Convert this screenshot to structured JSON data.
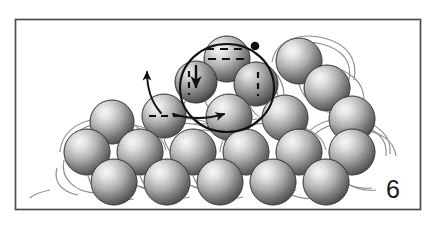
{
  "figure": {
    "panel_label": "6",
    "title": "",
    "frame": {
      "x": 15,
      "y": 19,
      "width": 406,
      "height": 191,
      "border_color": "#4d4d4d",
      "background_color": "#ffffff"
    },
    "canvas": {
      "width": 435,
      "height": 226,
      "background_color": "#ffffff"
    },
    "style": {
      "sphere_fill_light": "#fdfdfd",
      "sphere_fill_mid": "#c9c9c9",
      "sphere_fill_dark": "#8a8a8a",
      "sphere_edge_color": "#6e6e6e",
      "bond_color": "#8d8d8d",
      "annotation_color": "#111111",
      "dashed_color": "#111111"
    },
    "spheres": [
      {
        "name": "atom-back-row-1",
        "cx": 113,
        "cy": 125,
        "r": 22,
        "layer": "back"
      },
      {
        "name": "atom-back-row-2",
        "cx": 166,
        "cy": 125,
        "r": 22,
        "layer": "back"
      },
      {
        "name": "atom-back-row-3",
        "cx": 219,
        "cy": 125,
        "r": 22,
        "layer": "back"
      },
      {
        "name": "atom-back-row-4",
        "cx": 272,
        "cy": 125,
        "r": 22,
        "layer": "back"
      },
      {
        "name": "atom-back-row-5",
        "cx": 325,
        "cy": 125,
        "r": 22,
        "layer": "back"
      },
      {
        "name": "atom-upper-left-1",
        "cx": 112,
        "cy": 122,
        "r": 22,
        "layer": "upper"
      },
      {
        "name": "atom-upper-terrace-a",
        "cx": 163,
        "cy": 119,
        "r": 22,
        "layer": "upper"
      },
      {
        "name": "atom-upper-terrace-b",
        "cx": 267,
        "cy": 122,
        "r": 22,
        "layer": "upper"
      },
      {
        "name": "atom-upper-terrace-c",
        "cx": 320,
        "cy": 122,
        "r": 22,
        "layer": "upper"
      },
      {
        "name": "atom-ring-top",
        "cx": 227,
        "cy": 59,
        "r": 23,
        "layer": "ring"
      },
      {
        "name": "atom-ring-left",
        "cx": 196,
        "cy": 82,
        "r": 21,
        "layer": "ring"
      },
      {
        "name": "atom-ring-right",
        "cx": 256,
        "cy": 84,
        "r": 22,
        "layer": "ring"
      },
      {
        "name": "atom-ring-bottom",
        "cx": 229,
        "cy": 117,
        "r": 23,
        "layer": "ring"
      },
      {
        "name": "atom-adatom-marked",
        "cx": 164,
        "cy": 116,
        "r": 22,
        "layer": "marked"
      },
      {
        "name": "atom-upper-right-peak",
        "cx": 299,
        "cy": 61,
        "r": 23,
        "layer": "upper"
      },
      {
        "name": "atom-right-mid",
        "cx": 327,
        "cy": 88,
        "r": 23,
        "layer": "upper"
      },
      {
        "name": "atom-lower-row-1",
        "cx": 87,
        "cy": 152,
        "r": 23,
        "layer": "lower"
      },
      {
        "name": "atom-lower-row-2",
        "cx": 140,
        "cy": 152,
        "r": 23,
        "layer": "lower"
      },
      {
        "name": "atom-lower-row-3",
        "cx": 193,
        "cy": 152,
        "r": 23,
        "layer": "lower"
      },
      {
        "name": "atom-lower-row-4",
        "cx": 246,
        "cy": 152,
        "r": 23,
        "layer": "lower"
      },
      {
        "name": "atom-lower-row-5",
        "cx": 299,
        "cy": 152,
        "r": 23,
        "layer": "lower"
      },
      {
        "name": "atom-front-row-1",
        "cx": 114,
        "cy": 182,
        "r": 23,
        "layer": "front"
      },
      {
        "name": "atom-front-row-2",
        "cx": 167,
        "cy": 182,
        "r": 23,
        "layer": "front"
      },
      {
        "name": "atom-front-row-3",
        "cx": 220,
        "cy": 182,
        "r": 23,
        "layer": "front"
      },
      {
        "name": "atom-front-row-4",
        "cx": 273,
        "cy": 182,
        "r": 23,
        "layer": "front"
      }
    ],
    "annotations": {
      "ring_highlight": {
        "name": "six-membered-ring-path",
        "cx": 227,
        "cy": 88,
        "rx": 47,
        "ry": 44,
        "stroke_width": 2.1
      },
      "marker_dot": {
        "name": "ring-origin-dot",
        "cx": 255,
        "cy": 46,
        "r": 4.2
      },
      "dashed_segments": [
        {
          "name": "dash-top-atom-upper",
          "x1": 206,
          "y1": 49,
          "x2": 248,
          "y2": 49
        },
        {
          "name": "dash-top-atom-lower",
          "x1": 208,
          "y1": 58,
          "x2": 250,
          "y2": 58
        },
        {
          "name": "dash-ring-left-atom",
          "x1": 189,
          "y1": 72,
          "x2": 189,
          "y2": 94
        },
        {
          "name": "dash-ring-right-atom",
          "x1": 257,
          "y1": 73,
          "x2": 257,
          "y2": 95
        },
        {
          "name": "dash-adatom-marked",
          "x1": 150,
          "y1": 116,
          "x2": 180,
          "y2": 116
        }
      ],
      "arrows": [
        {
          "name": "arrow-hop-up-left",
          "path": "M 160 114 C 152 104 147 92 147 74",
          "head_angle": -92
        },
        {
          "name": "arrow-push-down",
          "path": "M 196 65 L 196 86",
          "head_angle": 90
        },
        {
          "name": "arrow-slide-right",
          "path": "M 172 113 C 192 119 208 118 224 114",
          "head_angle": -14
        }
      ]
    }
  }
}
